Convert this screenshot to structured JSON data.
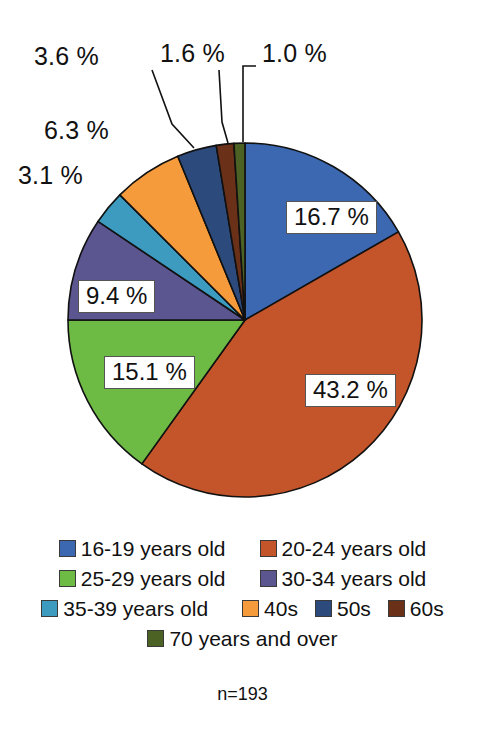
{
  "chart_data": {
    "type": "pie",
    "title": "",
    "subtitle": "",
    "sample_note": "n=193",
    "total_n": 193,
    "legend_position": "bottom",
    "grid": false,
    "categories": [
      "16-19 years old",
      "20-24 years old",
      "25-29 years old",
      "30-34 years old",
      "35-39 years old",
      "40s",
      "50s",
      "60s",
      "70 years and over"
    ],
    "values": [
      16.7,
      43.2,
      15.1,
      9.4,
      3.1,
      6.3,
      3.6,
      1.6,
      1.0
    ],
    "value_labels": [
      "16.7 %",
      "43.2 %",
      "15.1 %",
      "9.4 %",
      "3.1 %",
      "6.3 %",
      "3.6 %",
      "1.6 %",
      "1.0 %"
    ],
    "colors": [
      "#3B68B0",
      "#C4552A",
      "#6DBA44",
      "#5B5590",
      "#3D9BC0",
      "#F59B3C",
      "#2C4A7C",
      "#6B3018",
      "#4C6124"
    ],
    "unit": "%"
  },
  "labels": {
    "inside": [
      {
        "id": "slice-16-19",
        "text": "16.7 %"
      },
      {
        "id": "slice-20-24",
        "text": "43.2 %"
      },
      {
        "id": "slice-25-29",
        "text": "15.1 %"
      },
      {
        "id": "slice-30-34",
        "text": "9.4 %"
      }
    ],
    "outside": [
      {
        "id": "slice-35-39",
        "text": "3.1 %"
      },
      {
        "id": "slice-40s",
        "text": "6.3 %"
      },
      {
        "id": "slice-50s",
        "text": "3.6 %"
      },
      {
        "id": "slice-60s",
        "text": "1.6 %"
      },
      {
        "id": "slice-70plus",
        "text": "1.0 %"
      }
    ]
  },
  "legend": {
    "rows": [
      [
        {
          "label": "16-19 years old",
          "color": "#3B68B0"
        },
        {
          "label": "20-24 years old",
          "color": "#C4552A"
        }
      ],
      [
        {
          "label": "25-29 years old",
          "color": "#6DBA44"
        },
        {
          "label": "30-34 years old",
          "color": "#5B5590"
        }
      ],
      [
        {
          "label": "35-39 years old",
          "color": "#3D9BC0"
        },
        {
          "label": "40s",
          "color": "#F59B3C"
        },
        {
          "label": "50s",
          "color": "#2C4A7C"
        },
        {
          "label": "60s",
          "color": "#6B3018"
        }
      ],
      [
        {
          "label": "70 years and over",
          "color": "#4C6124"
        }
      ]
    ]
  },
  "footnote": {
    "text": "n=193"
  }
}
